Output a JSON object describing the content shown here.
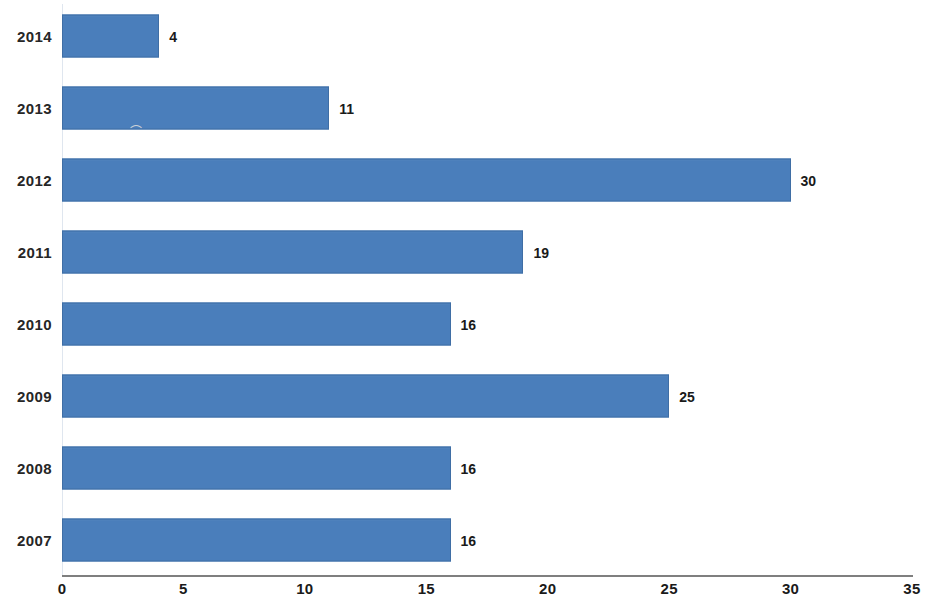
{
  "chart_data": {
    "type": "bar",
    "orientation": "horizontal",
    "title": "",
    "subtitle": "",
    "xlabel": "",
    "ylabel": "",
    "categories": [
      "2014",
      "2013",
      "2012",
      "2011",
      "2010",
      "2009",
      "2008",
      "2007"
    ],
    "values": [
      4,
      11,
      30,
      19,
      16,
      25,
      16,
      16
    ],
    "data_labels": [
      "4",
      "11",
      "30",
      "19",
      "16",
      "25",
      "16",
      "16"
    ],
    "xlim": [
      0,
      35
    ],
    "xticks": [
      0,
      5,
      10,
      15,
      20,
      25,
      30,
      35
    ],
    "xtick_labels": [
      "0",
      "5",
      "10",
      "15",
      "20",
      "25",
      "30",
      "35"
    ],
    "grid": false,
    "legend": false,
    "legend_position": "none",
    "series": [
      {
        "name": "",
        "color": "#4a7ebb",
        "values": [
          4,
          11,
          30,
          19,
          16,
          25,
          16,
          16
        ]
      }
    ]
  },
  "colors": {
    "bar_fill": "#4a7ebb",
    "bar_border": "#3f6ea5",
    "axis_line": "#7f7f7f",
    "text": "#1a1a1a",
    "background": "#ffffff"
  },
  "artifacts": {
    "smudge": "⌒"
  }
}
